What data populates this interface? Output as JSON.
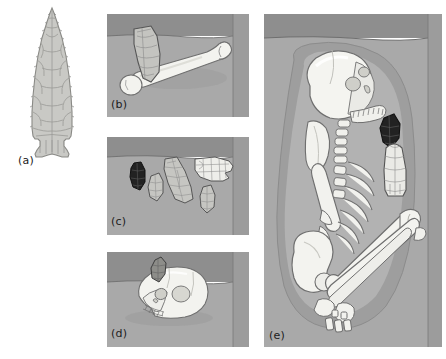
{
  "figure": {
    "background_color": "#ffffff",
    "width": 446,
    "height": 359,
    "panel_count": 5
  },
  "palette": {
    "soil_back_wall": "#8e8e8e",
    "soil_side_wall": "#9a9a9a",
    "soil_floor": "#a8a8a8",
    "soil_floor_light": "#b0b0b0",
    "bone_light": "#f2f2ee",
    "bone_shadow": "#d8d8d2",
    "bone_outline": "#6e6e6e",
    "stone_grey": "#c3c3c3",
    "stone_light": "#e6e6e2",
    "stone_dark": "#2a2a2a",
    "stone_outline": "#5a5a5a",
    "grave_stain_outer": "#9e9e9e",
    "grave_stain_inner": "#b4b4b4",
    "label_color": "#1b1b1b",
    "flake_scar_line": "#909090"
  },
  "panels": [
    {
      "id": "a",
      "label": "(a)",
      "caption_position": "below-left",
      "subject": "fluted-projectile-point",
      "description": "Large isolated line drawing of a lanceolate fluted projectile point showing flake scars and a concave base with basal ears.",
      "framed": false,
      "contents": [
        {
          "name": "projectile-point",
          "material": "chert",
          "shading": "light-grey",
          "features": [
            "flake-scars",
            "fluted-base",
            "basal-ears",
            "serrated-edges"
          ]
        }
      ]
    },
    {
      "id": "b",
      "label": "(b)",
      "caption_position": "inside-bottom-left",
      "subject": "bone-with-embedded-point",
      "description": "Excavation unit floor with a long limb bone (femur) lying diagonally; a fluted projectile point is embedded at its proximal end.",
      "framed": true,
      "contents": [
        {
          "name": "long-bone-femur",
          "material": "bone",
          "shading": "cream-white"
        },
        {
          "name": "embedded-projectile-point",
          "material": "chert",
          "shading": "grey-flaked"
        }
      ]
    },
    {
      "id": "c",
      "label": "(c)",
      "caption_position": "inside-bottom-left",
      "subject": "lithic-artifact-cluster",
      "description": "Excavation unit floor with a cluster of five chipped-stone artifacts of varying size and raw material.",
      "framed": true,
      "contents": [
        {
          "name": "obsidian-point",
          "material": "obsidian",
          "shading": "black"
        },
        {
          "name": "small-biface",
          "material": "chert",
          "shading": "grey"
        },
        {
          "name": "large-biface",
          "material": "chert",
          "shading": "grey-flaked"
        },
        {
          "name": "fluted-point-white",
          "material": "chalcedony",
          "shading": "white-flaked"
        },
        {
          "name": "small-point",
          "material": "chert",
          "shading": "grey"
        }
      ]
    },
    {
      "id": "d",
      "label": "(d)",
      "caption_position": "inside-bottom-left",
      "subject": "cranium-with-embedded-point",
      "description": "Excavation unit floor with a human cranium in left lateral view; a projectile point is lodged in the frontal bone.",
      "framed": true,
      "contents": [
        {
          "name": "human-cranium",
          "material": "bone",
          "shading": "cream-white"
        },
        {
          "name": "embedded-projectile-point",
          "material": "chert",
          "shading": "dark-grey"
        }
      ]
    },
    {
      "id": "e",
      "label": "(e)",
      "caption_position": "inside-bottom-left",
      "subject": "flexed-burial-plan-view",
      "description": "Plan view of a tightly flexed human burial within an oval grave stain, with two projectile points placed as grave goods beside the chest.",
      "framed": true,
      "contents": [
        {
          "name": "grave-stain-outline",
          "material": "soil-discoloration",
          "shading": "mid-grey-oval"
        },
        {
          "name": "human-skull",
          "material": "bone",
          "shading": "cream-white"
        },
        {
          "name": "mandible",
          "material": "bone",
          "shading": "cream-white"
        },
        {
          "name": "cervical-vertebrae",
          "material": "bone",
          "shading": "cream-white"
        },
        {
          "name": "rib-cage",
          "material": "bone",
          "shading": "cream-white"
        },
        {
          "name": "scapula",
          "material": "bone",
          "shading": "cream-white"
        },
        {
          "name": "pelvis",
          "material": "bone",
          "shading": "cream-white"
        },
        {
          "name": "femur",
          "material": "bone",
          "shading": "cream-white"
        },
        {
          "name": "tibia-fibula",
          "material": "bone",
          "shading": "cream-white"
        },
        {
          "name": "foot-bones",
          "material": "bone",
          "shading": "cream-white"
        },
        {
          "name": "grave-good-obsidian-point",
          "material": "obsidian",
          "shading": "black"
        },
        {
          "name": "grave-good-fluted-point",
          "material": "chalcedony",
          "shading": "white-flaked"
        }
      ]
    }
  ]
}
